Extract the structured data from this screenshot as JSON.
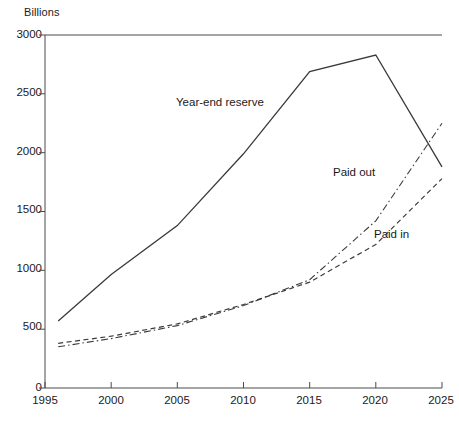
{
  "chart_data": {
    "type": "line",
    "title": "",
    "ylabel": "Billions",
    "xlabel": "",
    "xlim": [
      1995,
      2025
    ],
    "ylim": [
      0,
      3000
    ],
    "grid": false,
    "legend_position": "inline-annotations",
    "x_ticks": [
      "1995",
      "2000",
      "2005",
      "2010",
      "2015",
      "2020",
      "2025"
    ],
    "y_ticks": [
      "0",
      "500",
      "1000",
      "1500",
      "2000",
      "2500",
      "3000"
    ],
    "x": [
      1996,
      2000,
      2005,
      2010,
      2015,
      2020,
      2025
    ],
    "series": [
      {
        "name": "Year-end reserve",
        "style": "solid",
        "values": [
          570,
          965,
          1380,
          1990,
          2690,
          2830,
          1880
        ]
      },
      {
        "name": "Paid in",
        "style": "dashed",
        "values": [
          380,
          440,
          545,
          710,
          900,
          1220,
          1780
        ]
      },
      {
        "name": "Paid out",
        "style": "dash-dot",
        "values": [
          350,
          420,
          530,
          700,
          920,
          1420,
          2250
        ]
      }
    ],
    "annotations": [
      {
        "text": "Year-end reserve",
        "x_px": 176,
        "y_px": 96
      },
      {
        "text": "Paid out",
        "x_px": 333,
        "y_px": 166
      },
      {
        "text": "Paid in",
        "x_px": 374,
        "y_px": 228
      }
    ],
    "colors": {
      "line": "#3a3a3a",
      "axis": "#4a4a4a",
      "background": "#ffffff"
    }
  }
}
